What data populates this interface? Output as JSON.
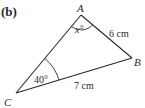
{
  "figure": {
    "part_label": "(b)",
    "vertices": {
      "A": {
        "label": "A",
        "x": 81,
        "y": 15
      },
      "B": {
        "label": "B",
        "x": 132,
        "y": 58
      },
      "C": {
        "label": "C",
        "x": 16,
        "y": 93
      }
    },
    "angles": {
      "A": "x°",
      "C": "40°"
    },
    "sides": {
      "AB": "6 cm",
      "CB": "7 cm"
    },
    "colors": {
      "line": "#2a2a2a",
      "background": "#ffffff"
    }
  }
}
